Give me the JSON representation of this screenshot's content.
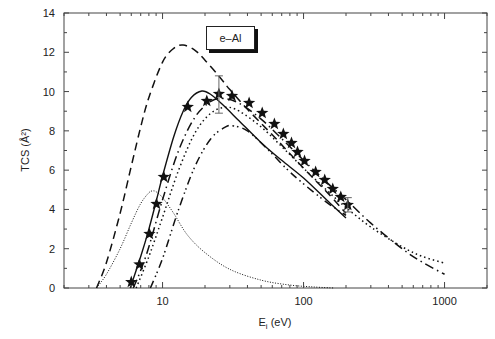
{
  "chart_data": {
    "type": "line",
    "title": "",
    "annotation": "e–Al",
    "xlabel": "E",
    "xlabel_sub": "i",
    "xlabel_unit": " (eV)",
    "ylabel": "TCS (Å²)",
    "xscale": "log",
    "xlim": [
      2,
      2000
    ],
    "ylim": [
      0,
      14
    ],
    "x_ticks": [
      10,
      100,
      1000
    ],
    "x_tick_labels": [
      "10",
      "100",
      "1000"
    ],
    "y_ticks": [
      0,
      2,
      4,
      6,
      8,
      10,
      12,
      14
    ],
    "y_tick_labels": [
      "0",
      "2",
      "4",
      "6",
      "8",
      "10",
      "12",
      "14"
    ],
    "grid": false,
    "series": [
      {
        "name": "solid",
        "style": "solid",
        "x": [
          5.9,
          7,
          8,
          9,
          10,
          12,
          14,
          16,
          19,
          22,
          27,
          35,
          50,
          70,
          100,
          150,
          200
        ],
        "y": [
          0,
          1.6,
          3.0,
          4.4,
          5.7,
          7.7,
          9.0,
          9.7,
          10.03,
          9.85,
          9.3,
          8.5,
          7.4,
          6.5,
          5.6,
          4.4,
          3.56
        ]
      },
      {
        "name": "dashed",
        "style": "dashed",
        "x": [
          3.4,
          4,
          5,
          6,
          7,
          8,
          10,
          12,
          14,
          17,
          20,
          25,
          30,
          40,
          60,
          100,
          150,
          200
        ],
        "y": [
          0,
          1.3,
          3.8,
          6.2,
          8.2,
          9.7,
          11.5,
          12.2,
          12.37,
          12.1,
          11.6,
          10.8,
          10.1,
          9.1,
          7.8,
          6.1,
          4.8,
          3.8
        ]
      },
      {
        "name": "dash-dot",
        "style": "dashdot",
        "x": [
          6.2,
          7,
          8,
          10,
          13,
          17,
          22,
          27,
          35,
          50,
          70,
          100,
          150,
          200,
          300,
          500,
          700,
          1000
        ],
        "y": [
          0,
          0.9,
          2.1,
          4.5,
          7.0,
          8.7,
          9.5,
          9.65,
          9.4,
          8.6,
          7.6,
          6.5,
          5.3,
          4.5,
          3.3,
          2.0,
          1.3,
          0.7
        ]
      },
      {
        "name": "dotted",
        "style": "dotted",
        "x": [
          6.5,
          8,
          10,
          13,
          17,
          22,
          28,
          35,
          50,
          70,
          100,
          150,
          200,
          300,
          500,
          700,
          1000
        ],
        "y": [
          0,
          1.6,
          3.6,
          6.0,
          7.9,
          8.9,
          9.2,
          9.0,
          8.2,
          7.2,
          6.1,
          4.9,
          4.1,
          3.1,
          2.1,
          1.6,
          1.27
        ]
      },
      {
        "name": "dash-dot-dot",
        "style": "dashdotdot",
        "x": [
          8.2,
          10,
          13,
          17,
          22,
          28,
          32,
          40,
          55,
          75,
          100,
          150,
          200
        ],
        "y": [
          0,
          1.5,
          4.0,
          6.2,
          7.6,
          8.2,
          8.25,
          8.0,
          7.1,
          6.1,
          5.3,
          4.3,
          3.7
        ]
      },
      {
        "name": "dotted-low",
        "style": "finedotted",
        "x": [
          3.4,
          4,
          5,
          6,
          7,
          8,
          8.5,
          9,
          10,
          12,
          15,
          20,
          30,
          50,
          80,
          120,
          165
        ],
        "y": [
          0,
          0.7,
          2.0,
          3.3,
          4.3,
          4.85,
          4.94,
          4.9,
          4.6,
          3.8,
          2.7,
          1.8,
          0.95,
          0.4,
          0.15,
          0.05,
          0
        ]
      },
      {
        "name": "experiment",
        "style": "stars",
        "x": [
          6.0,
          6.85,
          8.07,
          9.06,
          10.2,
          15.1,
          20.6,
          25.1,
          31.1,
          41.1,
          50.9,
          62.1,
          71.9,
          82.1,
          90.6,
          101.6,
          121.8,
          141.3,
          161.1,
          183.7,
          206
        ],
        "y": [
          0.3,
          1.2,
          2.75,
          4.28,
          5.65,
          9.22,
          9.52,
          9.88,
          9.78,
          9.42,
          8.91,
          8.35,
          7.84,
          7.38,
          6.92,
          6.47,
          5.91,
          5.5,
          5.04,
          4.63,
          4.23
        ]
      }
    ],
    "error_bars": [
      {
        "x": 25.1,
        "y_low": 8.9,
        "y_high": 10.8
      },
      {
        "x": 206,
        "y_low": 3.87,
        "y_high": 4.6
      }
    ]
  }
}
